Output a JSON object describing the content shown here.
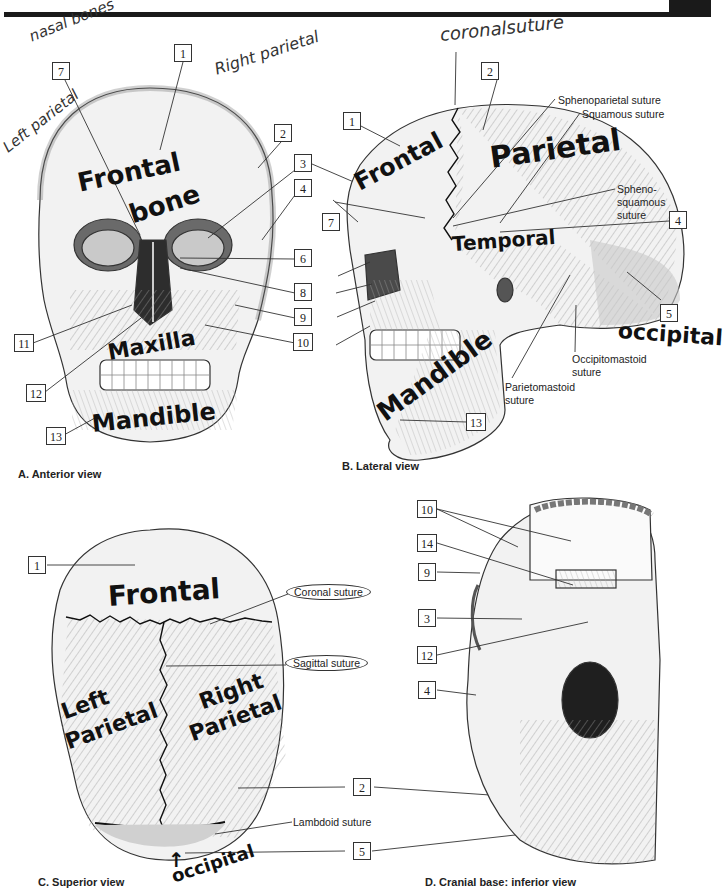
{
  "figure": {
    "panels": [
      {
        "id": "A",
        "caption": "A. Anterior view",
        "number_labels": [
          "1",
          "2",
          "3",
          "4",
          "6",
          "7",
          "8",
          "9",
          "10",
          "11",
          "12",
          "13"
        ],
        "handwritten": {
          "nasal_bones": "nasal bones",
          "right_parietal": "Right parietal",
          "left_parietal": "Left parietal",
          "frontal_bone_line1": "Frontal",
          "frontal_bone_line2": "bone",
          "maxilla": "Maxilla",
          "mandible": "Mandible"
        }
      },
      {
        "id": "B",
        "caption": "B. Lateral view",
        "number_labels": [
          "1",
          "2",
          "3",
          "4",
          "5",
          "7",
          "8",
          "9",
          "10",
          "13"
        ],
        "printed_labels": {
          "sphenoparietal": "Sphenoparietal suture",
          "squamous": "Squamous suture",
          "sphenosquamous_l1": "Spheno-",
          "sphenosquamous_l2": "squamous",
          "sphenosquamous_l3": "suture",
          "occipitomastoid_l1": "Occipitomastoid",
          "occipitomastoid_l2": "suture",
          "parietomastoid_l1": "Parietomastoid",
          "parietomastoid_l2": "suture"
        },
        "handwritten": {
          "coronal_suture": "coronalsuture",
          "frontal": "Frontal",
          "parietal": "Parietal",
          "temporal": "Temporal",
          "occipital": "occipital",
          "mandible": "Mandible"
        }
      },
      {
        "id": "C",
        "caption": "C. Superior view",
        "number_labels": [
          "1",
          "2",
          "5"
        ],
        "printed_labels": {
          "coronal": "Coronal suture",
          "sagittal": "Sagittal suture",
          "lambdoid": "Lambdoid suture"
        },
        "handwritten": {
          "frontal": "Frontal",
          "left_parietal_l1": "Left",
          "left_parietal_l2": "Parietal",
          "right_parietal_l1": "Right",
          "right_parietal_l2": "Parietal",
          "occipital": "occipital"
        }
      },
      {
        "id": "D",
        "caption": "D. Cranial base: inferior view",
        "number_labels": [
          "10",
          "14",
          "9",
          "3",
          "12",
          "4"
        ]
      }
    ],
    "colors": {
      "ink": "#111111",
      "line": "#333333",
      "bone_fill": "#f2f2f2",
      "shade": "#c8c8c8",
      "bar": "#1a1a1a"
    }
  }
}
